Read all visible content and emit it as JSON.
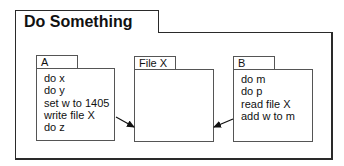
{
  "frame": {
    "title": "Do Something"
  },
  "processes": [
    {
      "id": "A",
      "label": "A",
      "steps": [
        "do x",
        "do y",
        "set w to 1405",
        "write file X",
        "do z"
      ]
    },
    {
      "id": "B",
      "label": "B",
      "steps": [
        "do m",
        "do p",
        "read file X",
        "add w to m"
      ]
    }
  ],
  "file": {
    "label": "File X"
  },
  "arrows": [
    {
      "from": "A",
      "to": "File X",
      "meaning": "write file X"
    },
    {
      "from": "B",
      "to": "File X",
      "meaning": "read file X"
    }
  ],
  "colors": {
    "frame_border": "#2a2a2a",
    "box_border": "#555555",
    "background": "#ffffff",
    "text": "#111111"
  }
}
